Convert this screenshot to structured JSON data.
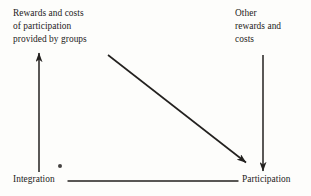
{
  "figure": {
    "background_color": "#fdfdfb",
    "ink_color": "#1d1c1b",
    "width": 311,
    "height": 196
  },
  "nodes": {
    "top_left": {
      "name": "rewards-costs-groups",
      "text": "Rewards and costs\nof participation\nprovided by groups",
      "lines": [
        "Rewards and costs",
        "of participation",
        "provided by groups"
      ]
    },
    "top_right": {
      "name": "other-rewards-costs",
      "text": "Other\nrewards and\ncosts",
      "lines": [
        "Other",
        "rewards and",
        "costs"
      ]
    },
    "bottom_left": {
      "name": "integration",
      "text": "Integration",
      "lines": [
        "Integration"
      ]
    },
    "bottom_right": {
      "name": "participation",
      "text": "Participation",
      "lines": [
        "Participation"
      ]
    }
  },
  "connectors": [
    {
      "name": "integration-to-rewards-arrow",
      "from": "Integration",
      "to": "Rewards and costs of participation provided by groups",
      "direction": "up",
      "arrowhead": "end",
      "x1": 39,
      "y1": 172,
      "x2": 39,
      "y2": 52
    },
    {
      "name": "other-rewards-to-participation-arrow",
      "from": "Other rewards and costs",
      "to": "Participation",
      "direction": "down",
      "arrowhead": "end",
      "x1": 263,
      "y1": 55,
      "x2": 263,
      "y2": 172
    },
    {
      "name": "rewards-to-participation-diagonal-arrow",
      "from": "Rewards and costs of participation provided by groups",
      "to": "Participation",
      "direction": "down-right",
      "arrowhead": "end",
      "x1": 108,
      "y1": 55,
      "x2": 247,
      "y2": 163
    },
    {
      "name": "integration-participation-line",
      "from": "Integration",
      "to": "Participation",
      "direction": "horizontal",
      "arrowhead": "none",
      "x1": 68,
      "y1": 181,
      "x2": 238,
      "y2": 181
    }
  ],
  "artifacts": [
    {
      "name": "scan-speck",
      "x": 58,
      "y": 164
    }
  ]
}
